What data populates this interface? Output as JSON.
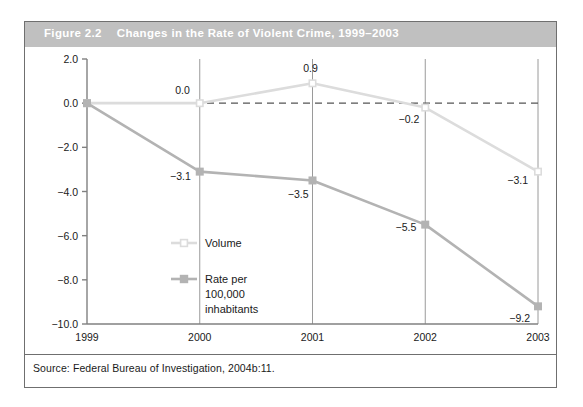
{
  "figure": {
    "number": "Figure 2.2",
    "title": "Changes in the Rate of Violent Crime, 1999–2003",
    "source_note": "Source: Federal Bureau of Investigation, 2004b:11."
  },
  "colors": {
    "title_bar": "#c0c0c0",
    "title_text": "#ffffff",
    "frame_border": "#6f6f6f",
    "axis": "#808080",
    "gridline": "#9a9a9a",
    "zero_line": "#555555",
    "volume_series": "#dcdcdc",
    "rate_series": "#b3b3b3",
    "text": "#1a1a1a"
  },
  "chart_data": {
    "type": "line",
    "title": "Changes in the Rate of Violent Crime, 1999–2003",
    "xlabel": "",
    "ylabel": "",
    "categories": [
      "1999",
      "2000",
      "2001",
      "2002",
      "2003"
    ],
    "x_tick_labels": [
      "1999",
      "2000",
      "2001",
      "2002",
      "2003"
    ],
    "y_tick_labels": [
      "2.0",
      "0.0",
      "−2.0",
      "−4.0",
      "−6.0",
      "−8.0",
      "−10.0"
    ],
    "y_ticks": [
      2.0,
      0.0,
      -2.0,
      -4.0,
      -6.0,
      -8.0,
      -10.0
    ],
    "ylim": [
      -10.0,
      2.0
    ],
    "grid": "vertical",
    "zero_reference_line": true,
    "legend_position": "inside-center-left",
    "series": [
      {
        "name": "Volume",
        "color": "#dcdcdc",
        "marker": "open-square",
        "values": [
          0.0,
          0.0,
          0.9,
          -0.2,
          -3.1
        ],
        "point_labels": [
          "",
          "0.0",
          "0.9",
          "−0.2",
          "−3.1"
        ]
      },
      {
        "name": "Rate per 100,000 inhabitants",
        "color": "#b3b3b3",
        "marker": "filled-square",
        "values": [
          0.0,
          -3.1,
          -3.5,
          -5.5,
          -9.2
        ],
        "point_labels": [
          "",
          "−3.1",
          "−3.5",
          "−5.5",
          "−9.2"
        ]
      }
    ],
    "legend_entries": [
      {
        "label": "Volume",
        "lines": [
          "Volume"
        ]
      },
      {
        "label": "Rate per 100,000 inhabitants",
        "lines": [
          "Rate per",
          "100,000",
          "inhabitants"
        ]
      }
    ]
  }
}
